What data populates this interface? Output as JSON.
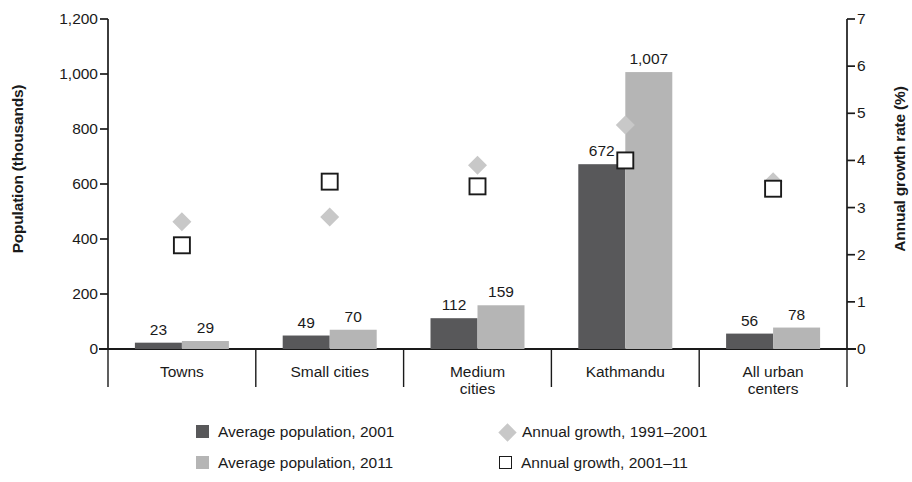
{
  "chart_data": {
    "type": "bar",
    "title": "",
    "subtitle": "",
    "xlabel": "",
    "ylabel": "Population (thousands)",
    "y2label": "Annual growth rate (%)",
    "categories": [
      "Towns",
      "Small cities",
      "Medium cities",
      "Kathmandu",
      "All urban centers"
    ],
    "category_lines": [
      [
        "Towns"
      ],
      [
        "Small cities"
      ],
      [
        "Medium",
        "cities"
      ],
      [
        "Kathmandu"
      ],
      [
        "All urban",
        "centers"
      ]
    ],
    "ylim": [
      0,
      1200
    ],
    "y2lim": [
      0,
      7
    ],
    "yticks": [
      0,
      200,
      400,
      600,
      800,
      1000,
      1200
    ],
    "ytick_labels": [
      "0",
      "200",
      "400",
      "600",
      "800",
      "1,000",
      "1,200"
    ],
    "y2ticks": [
      0,
      1,
      2,
      3,
      4,
      5,
      6,
      7
    ],
    "y2tick_labels": [
      "0",
      "1",
      "2",
      "3",
      "4",
      "5",
      "6",
      "7"
    ],
    "grid": false,
    "legend_position": "bottom",
    "series": [
      {
        "name": "Average population, 2001",
        "kind": "bar",
        "axis": "left",
        "color": "#58585a",
        "values": [
          23,
          49,
          112,
          672,
          56
        ],
        "labels": [
          "23",
          "49",
          "112",
          "672",
          "56"
        ]
      },
      {
        "name": "Average population, 2011",
        "kind": "bar",
        "axis": "left",
        "color": "#b5b5b5",
        "values": [
          29,
          70,
          159,
          1007,
          78
        ],
        "labels": [
          "29",
          "70",
          "159",
          "1,007",
          "78"
        ]
      },
      {
        "name": "Annual growth, 1991–2001",
        "kind": "marker-diamond",
        "axis": "right",
        "color": "#c8c8c8",
        "values": [
          2.7,
          2.8,
          3.9,
          4.75,
          3.55
        ]
      },
      {
        "name": "Annual growth, 2001–11",
        "kind": "marker-square-open",
        "axis": "right",
        "color": "#1a1a1a",
        "values": [
          2.2,
          3.55,
          3.45,
          4.0,
          3.4
        ]
      }
    ]
  },
  "legend": {
    "items": [
      {
        "label": "Average population, 2001",
        "marker": "filled-square-dark"
      },
      {
        "label": "Annual growth, 1991–2001",
        "marker": "filled-diamond-light"
      },
      {
        "label": "Average population, 2011",
        "marker": "filled-square-light"
      },
      {
        "label": "Annual growth, 2001–11",
        "marker": "open-square"
      }
    ]
  },
  "colors": {
    "bar_2001": "#58585a",
    "bar_2011": "#b5b5b5",
    "diamond": "#c8c8c8",
    "axis": "#1a1a1a",
    "text": "#1a1a1a",
    "background": "#ffffff"
  }
}
